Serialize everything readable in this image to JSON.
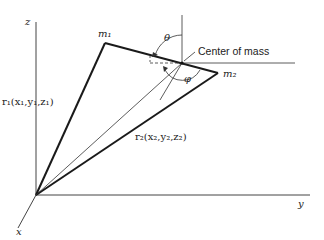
{
  "diagram": {
    "axes": {
      "z": "z",
      "y": "y",
      "x": "x"
    },
    "masses": {
      "m1": "m₁",
      "m2": "m₂"
    },
    "vectors": {
      "r1": "r₁(x₁,y₁,z₁)",
      "r2": "r₂(x₂,y₂,z₂)"
    },
    "angles": {
      "theta": "θ",
      "phi": "φ"
    },
    "center_label": "Center of mass",
    "colors": {
      "line": "#1a1a1a",
      "background": "#ffffff"
    }
  }
}
